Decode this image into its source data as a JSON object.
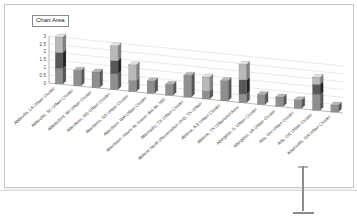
{
  "window": {
    "tooltip_label": "Chart Area",
    "sheet_background": "#f2f2f2",
    "chart_background": "#ffffff",
    "border_color": "#c9c9c9"
  },
  "cursor": {
    "name": "i-beam-cursor",
    "color": "#8c8c8c"
  },
  "chart_data": {
    "type": "bar",
    "subtype": "3d-stacked-column",
    "title": "",
    "subtitle": "",
    "xlabel": "",
    "ylabel": "",
    "ylim": [
      0,
      3
    ],
    "ytick_labels": [
      "0",
      "0.5",
      "1",
      "1.5",
      "2",
      "2.5",
      "3"
    ],
    "ytick_values": [
      0,
      0.5,
      1,
      1.5,
      2,
      2.5,
      3
    ],
    "grid": true,
    "legend": false,
    "legend_position": "none",
    "series_colors": [
      "#8f8f8f",
      "#585858",
      "#b9b9b9"
    ],
    "categories": [
      "Abbeville, LA Urban Cluster",
      "Abbeville, SC Urban Cluster",
      "Abbotsford, WI Urban Cluster",
      "Aberdeen, MS Urban Cluster",
      "Aberdeen, SD Urban Cluster",
      "Aberdeen, WA Urban Cluster",
      "Aberdeen--Havre de Grace--Bel Air, MD",
      "Abernathy, TX Urban Cluster",
      "Abilene North (Reservation Unit), TX Urban",
      "Abilene, KS Urban Cluster",
      "Abilene, TX Urbanized Area",
      "Abingdon, IL Urban Cluster",
      "Abingdon, VA Urban Cluster",
      "Ada, OH Urban Cluster",
      "Ada, OK Urban Cluster",
      "Adairsville, GA Urban Cluster"
    ],
    "series": [
      {
        "name": "Series 1",
        "color": "#8f8f8f",
        "values": [
          1.0,
          1.0,
          1.0,
          1.0,
          0.7,
          0.8,
          0.7,
          1.4,
          0.5,
          1.3,
          0.55,
          0.65,
          0.6,
          0.55,
          1.0,
          0.45
        ]
      },
      {
        "name": "Series 2",
        "color": "#585858",
        "values": [
          1.0,
          0.0,
          0.0,
          0.85,
          0.0,
          0.0,
          0.0,
          0.0,
          0.0,
          0.0,
          0.9,
          0.0,
          0.0,
          0.0,
          0.65,
          0.0
        ]
      },
      {
        "name": "Series 3",
        "color": "#b9b9b9",
        "values": [
          1.0,
          0.0,
          0.0,
          0.95,
          1.0,
          0.0,
          0.0,
          0.0,
          0.9,
          0.0,
          1.0,
          0.0,
          0.0,
          0.0,
          0.45,
          0.0
        ]
      }
    ],
    "totals": [
      3.0,
      1.0,
      1.0,
      2.8,
      1.7,
      0.8,
      0.7,
      1.4,
      1.4,
      1.3,
      2.45,
      0.65,
      0.6,
      0.55,
      2.1,
      0.45
    ]
  }
}
